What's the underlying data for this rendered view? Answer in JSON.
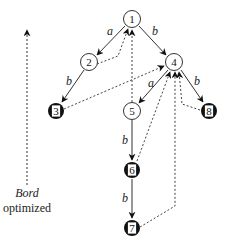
{
  "legend": {
    "line1": "Bord",
    "line2": "optimized"
  },
  "nodes": [
    {
      "id": "1",
      "label": "1",
      "x": 132,
      "y": 19,
      "style": "white"
    },
    {
      "id": "2",
      "label": "2",
      "x": 89,
      "y": 62,
      "style": "white"
    },
    {
      "id": "3",
      "label": "3",
      "x": 56,
      "y": 111,
      "style": "black"
    },
    {
      "id": "4",
      "label": "4",
      "x": 174,
      "y": 62,
      "style": "white"
    },
    {
      "id": "5",
      "label": "5",
      "x": 132,
      "y": 111,
      "style": "white"
    },
    {
      "id": "6",
      "label": "6",
      "x": 132,
      "y": 170,
      "style": "black"
    },
    {
      "id": "7",
      "label": "7",
      "x": 132,
      "y": 228,
      "style": "black"
    },
    {
      "id": "8",
      "label": "8",
      "x": 209,
      "y": 111,
      "style": "black"
    }
  ],
  "edges": [
    {
      "from": "1",
      "to": "2",
      "label": "a",
      "type": "solid"
    },
    {
      "from": "1",
      "to": "4",
      "label": "b",
      "type": "solid"
    },
    {
      "from": "2",
      "to": "3",
      "label": "b",
      "type": "solid"
    },
    {
      "from": "4",
      "to": "5",
      "label": "a",
      "type": "solid"
    },
    {
      "from": "4",
      "to": "8",
      "label": "b",
      "type": "solid"
    },
    {
      "from": "5",
      "to": "6",
      "label": "b",
      "type": "solid"
    },
    {
      "from": "6",
      "to": "7",
      "label": "b",
      "type": "solid"
    },
    {
      "from": "2",
      "to": "1",
      "label": "",
      "type": "dashed"
    },
    {
      "from": "5",
      "to": "1",
      "label": "",
      "type": "dashed"
    },
    {
      "from": "3",
      "to": "4",
      "label": "",
      "type": "dashed"
    },
    {
      "from": "6",
      "to": "4",
      "label": "",
      "type": "dashed"
    },
    {
      "from": "7",
      "to": "4",
      "label": "",
      "type": "dashed"
    },
    {
      "from": "8",
      "to": "4",
      "label": "",
      "type": "dashed"
    }
  ],
  "edge_labels": {
    "e12": "a",
    "e14": "b",
    "e23": "b",
    "e45": "a",
    "e48": "b",
    "e56": "b",
    "e67": "b"
  },
  "colors": {
    "stroke": "#222222",
    "fill_black": "#111111",
    "fill_white": "#ffffff"
  }
}
